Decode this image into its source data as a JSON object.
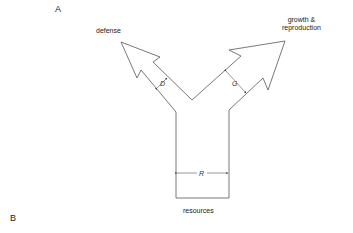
{
  "panels": {
    "a": "A",
    "b": "B"
  },
  "labels": {
    "defense": "defense",
    "growth_line1": "growth &",
    "growth_line2": "reproduction",
    "resources": "resources"
  },
  "dimensions": {
    "d": "D",
    "g": "G",
    "r": "R"
  },
  "colors": {
    "stroke": "#555555",
    "text": "#222222"
  }
}
